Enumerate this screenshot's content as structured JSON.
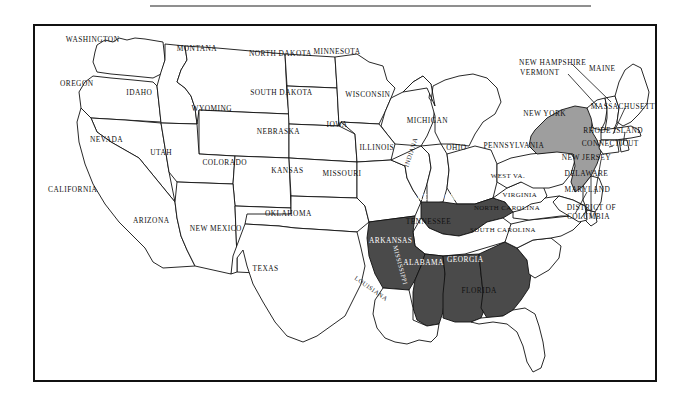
{
  "page": {
    "header_caption": "",
    "background_color": "#ffffff"
  },
  "map": {
    "name": "united-states-map",
    "frame_color": "#111111",
    "outline_color": "#111111",
    "fills": {
      "unshaded": "#ffffff",
      "dark_shaded": "#4a4a4a",
      "medium_shaded": "#9e9e9e"
    },
    "legend_note": "",
    "highlighted_states_dark": [
      "KENTUCKY",
      "ARKANSAS",
      "MISSISSIPPI",
      "ALABAMA",
      "GEORGIA"
    ],
    "highlighted_states_medium": [
      "NEW YORK"
    ],
    "highlighted_states_light": [
      "TENNESSEE"
    ],
    "states": [
      {
        "name": "WASHINGTON",
        "x": 91,
        "y": 38,
        "shade": "unshaded",
        "rotate": 0,
        "size": "normal"
      },
      {
        "name": "OREGON",
        "x": 75,
        "y": 83,
        "shade": "unshaded",
        "rotate": 0,
        "size": "normal"
      },
      {
        "name": "IDAHO",
        "x": 138,
        "y": 92,
        "shade": "unshaded",
        "rotate": 0,
        "size": "normal"
      },
      {
        "name": "MONTANA",
        "x": 196,
        "y": 48,
        "shade": "unshaded",
        "rotate": 0,
        "size": "normal"
      },
      {
        "name": "WYOMING",
        "x": 211,
        "y": 108,
        "shade": "unshaded",
        "rotate": 0,
        "size": "normal"
      },
      {
        "name": "NEVADA",
        "x": 105,
        "y": 140,
        "shade": "unshaded",
        "rotate": 0,
        "size": "normal"
      },
      {
        "name": "UTAH",
        "x": 160,
        "y": 153,
        "shade": "unshaded",
        "rotate": 0,
        "size": "normal"
      },
      {
        "name": "COLORADO",
        "x": 224,
        "y": 163,
        "shade": "unshaded",
        "rotate": 0,
        "size": "normal"
      },
      {
        "name": "CALIFORNIA",
        "x": 71,
        "y": 190,
        "shade": "unshaded",
        "rotate": 0,
        "size": "normal"
      },
      {
        "name": "ARIZONA",
        "x": 150,
        "y": 221,
        "shade": "unshaded",
        "rotate": 0,
        "size": "normal"
      },
      {
        "name": "NEW MEXICO",
        "x": 215,
        "y": 230,
        "shade": "unshaded",
        "rotate": 0,
        "size": "normal"
      },
      {
        "name": "NORTH DAKOTA",
        "x": 280,
        "y": 53,
        "shade": "unshaded",
        "rotate": 0,
        "size": "normal"
      },
      {
        "name": "SOUTH DAKOTA",
        "x": 281,
        "y": 92,
        "shade": "unshaded",
        "rotate": 0,
        "size": "normal"
      },
      {
        "name": "NEBRASKA",
        "x": 278,
        "y": 131,
        "shade": "unshaded",
        "rotate": 0,
        "size": "normal"
      },
      {
        "name": "KANSAS",
        "x": 287,
        "y": 171,
        "shade": "unshaded",
        "rotate": 0,
        "size": "normal"
      },
      {
        "name": "OKLAHOMA",
        "x": 288,
        "y": 214,
        "shade": "unshaded",
        "rotate": 0,
        "size": "normal"
      },
      {
        "name": "TEXAS",
        "x": 265,
        "y": 270,
        "shade": "unshaded",
        "rotate": 0,
        "size": "normal"
      },
      {
        "name": "MINNESOTA",
        "x": 337,
        "y": 51,
        "shade": "unshaded",
        "rotate": 0,
        "size": "normal"
      },
      {
        "name": "WISCONSIN",
        "x": 368,
        "y": 94,
        "shade": "unshaded",
        "rotate": 0,
        "size": "normal"
      },
      {
        "name": "IOWA",
        "x": 337,
        "y": 124,
        "shade": "unshaded",
        "rotate": 0,
        "size": "normal"
      },
      {
        "name": "MISSOURI",
        "x": 342,
        "y": 174,
        "shade": "unshaded",
        "rotate": 0,
        "size": "normal"
      },
      {
        "name": "ILLINOIS",
        "x": 377,
        "y": 148,
        "shade": "unshaded",
        "rotate": 0,
        "size": "normal"
      },
      {
        "name": "INDIANA",
        "x": 412,
        "y": 152,
        "shade": "unshaded",
        "rotate": -72,
        "size": "tiny"
      },
      {
        "name": "MICHIGAN",
        "x": 428,
        "y": 120,
        "shade": "unshaded",
        "rotate": 0,
        "size": "normal"
      },
      {
        "name": "OHIO",
        "x": 457,
        "y": 148,
        "shade": "unshaded",
        "rotate": 0,
        "size": "normal"
      },
      {
        "name": "KENTUCKY",
        "x": 440,
        "y": 198,
        "shade": "dark",
        "rotate": 0,
        "size": "normal"
      },
      {
        "name": "TENNESSEE",
        "x": 429,
        "y": 223,
        "shade": "light",
        "rotate": 0,
        "size": "normal"
      },
      {
        "name": "ARKANSAS",
        "x": 391,
        "y": 242,
        "shade": "dark",
        "rotate": 0,
        "size": "normal"
      },
      {
        "name": "MISSISSIPPI",
        "x": 400,
        "y": 266,
        "shade": "dark",
        "rotate": 75,
        "size": "tiny"
      },
      {
        "name": "LOUISIANA",
        "x": 371,
        "y": 290,
        "shade": "unshaded",
        "rotate": 35,
        "size": "tiny"
      },
      {
        "name": "ALABAMA",
        "x": 424,
        "y": 264,
        "shade": "dark",
        "rotate": 0,
        "size": "normal"
      },
      {
        "name": "GEORGIA",
        "x": 466,
        "y": 261,
        "shade": "dark",
        "rotate": 0,
        "size": "normal"
      },
      {
        "name": "FLORIDA",
        "x": 480,
        "y": 292,
        "shade": "unshaded",
        "rotate": 0,
        "size": "normal"
      },
      {
        "name": "SOUTH CAROLINA",
        "x": 504,
        "y": 231,
        "shade": "unshaded",
        "rotate": 0,
        "size": "small"
      },
      {
        "name": "NORTH CAROLINA",
        "x": 508,
        "y": 208,
        "shade": "unshaded",
        "rotate": 0,
        "size": "small"
      },
      {
        "name": "VIRGINIA",
        "x": 521,
        "y": 195,
        "shade": "unshaded",
        "rotate": 0,
        "size": "small"
      },
      {
        "name": "WEST VA.",
        "x": 509,
        "y": 176,
        "shade": "unshaded",
        "rotate": 0,
        "size": "small"
      },
      {
        "name": "PENNSYLVANIA",
        "x": 515,
        "y": 146,
        "shade": "unshaded",
        "rotate": 0,
        "size": "normal"
      },
      {
        "name": "NEW YORK",
        "x": 546,
        "y": 113,
        "shade": "medium",
        "rotate": 0,
        "size": "normal"
      },
      {
        "name": "VERMONT",
        "x": 541,
        "y": 72,
        "shade": "unshaded",
        "rotate": 0,
        "size": "normal"
      },
      {
        "name": "NEW HAMPSHIRE",
        "x": 554,
        "y": 62,
        "shade": "unshaded",
        "rotate": 0,
        "size": "normal"
      },
      {
        "name": "MAINE",
        "x": 604,
        "y": 68,
        "shade": "unshaded",
        "rotate": 0,
        "size": "normal"
      },
      {
        "name": "MASSACHUSETTS",
        "x": 627,
        "y": 106,
        "shade": "unshaded",
        "rotate": 0,
        "size": "normal"
      },
      {
        "name": "RHODE ISLAND",
        "x": 615,
        "y": 130,
        "shade": "unshaded",
        "rotate": 0,
        "size": "normal"
      },
      {
        "name": "CONNECTICUT",
        "x": 612,
        "y": 144,
        "shade": "unshaded",
        "rotate": 0,
        "size": "normal"
      },
      {
        "name": "NEW JERSEY",
        "x": 588,
        "y": 158,
        "shade": "unshaded",
        "rotate": 0,
        "size": "normal"
      },
      {
        "name": "DELAWARE",
        "x": 588,
        "y": 174,
        "shade": "unshaded",
        "rotate": 0,
        "size": "normal"
      },
      {
        "name": "MARYLAND",
        "x": 589,
        "y": 190,
        "shade": "unshaded",
        "rotate": 0,
        "size": "normal"
      },
      {
        "name": "DISTRICT OF",
        "x": 593,
        "y": 208,
        "shade": "unshaded",
        "rotate": 0,
        "size": "normal"
      },
      {
        "name": "COLUMBIA",
        "x": 590,
        "y": 217,
        "shade": "unshaded",
        "rotate": 0,
        "size": "normal"
      }
    ]
  }
}
